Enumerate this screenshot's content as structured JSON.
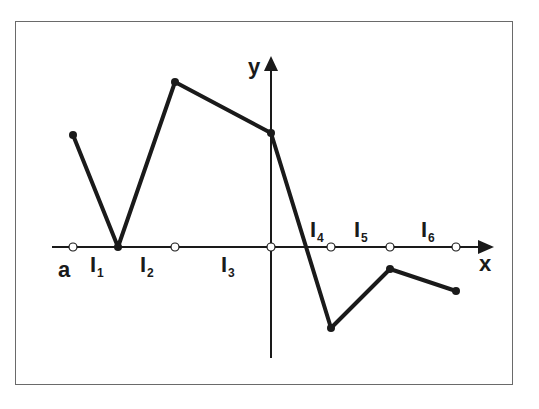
{
  "diagram": {
    "axes": {
      "x_label": "x",
      "y_label": "y",
      "left_endpoint_label": "a"
    },
    "intervals": [
      {
        "label": "I",
        "sub": "1"
      },
      {
        "label": "I",
        "sub": "2"
      },
      {
        "label": "I",
        "sub": "3"
      },
      {
        "label": "I",
        "sub": "4"
      },
      {
        "label": "I",
        "sub": "5"
      },
      {
        "label": "I",
        "sub": "6"
      }
    ],
    "polyline_points": [
      {
        "x": 73,
        "y": 135
      },
      {
        "x": 118,
        "y": 247
      },
      {
        "x": 175,
        "y": 82
      },
      {
        "x": 271,
        "y": 133
      },
      {
        "x": 331,
        "y": 328
      },
      {
        "x": 390,
        "y": 269
      },
      {
        "x": 456,
        "y": 291
      }
    ],
    "open_circles_x": [
      73,
      175,
      271,
      331,
      390,
      456
    ],
    "colors": {
      "line": "#1a1a1a",
      "frame": "#6a6a6a",
      "background": "#ffffff"
    }
  }
}
